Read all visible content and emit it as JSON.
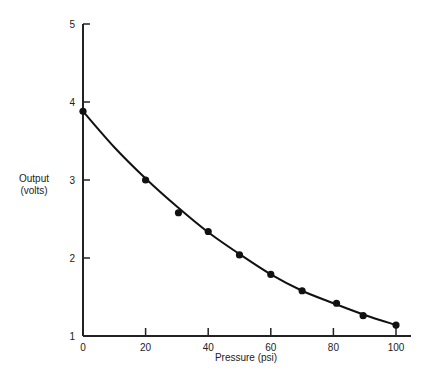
{
  "chart_data": {
    "type": "scatter",
    "title": "",
    "xlabel": "Pressure (psi)",
    "ylabel_lines": [
      "Output",
      "(volts)"
    ],
    "xlim": [
      0,
      100
    ],
    "ylim": [
      1,
      5
    ],
    "x_ticks": [
      0,
      20,
      40,
      60,
      80,
      100
    ],
    "y_ticks": [
      1,
      2,
      3,
      4,
      5
    ],
    "grid": false,
    "legend": null,
    "series": [
      {
        "name": "Measured output",
        "marker": "filled-circle",
        "x": [
          0,
          20,
          30.5,
          40,
          50,
          60,
          70,
          81,
          89.5,
          100
        ],
        "y": [
          3.88,
          3.0,
          2.58,
          2.34,
          2.04,
          1.79,
          1.58,
          1.42,
          1.26,
          1.14
        ]
      },
      {
        "name": "Fitted curve",
        "style": "smooth-line",
        "x": [
          0,
          10,
          20,
          30,
          40,
          50,
          60,
          70,
          80,
          90,
          100
        ],
        "y": [
          3.88,
          3.42,
          3.02,
          2.66,
          2.33,
          2.05,
          1.79,
          1.58,
          1.42,
          1.27,
          1.14
        ]
      }
    ],
    "colors": {
      "line": "#111111",
      "axis": "#222222",
      "background": "#ffffff"
    }
  }
}
